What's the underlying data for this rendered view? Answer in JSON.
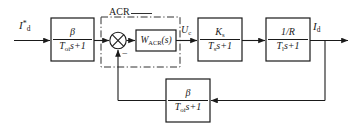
{
  "diagram": {
    "type": "control-block-diagram",
    "stroke_color": "#1a1a1a",
    "text_color": "#1a1a1a",
    "background": "#ffffff"
  },
  "labels": {
    "input_reference": "I",
    "input_reference_sub": "d",
    "input_reference_sup": "*",
    "acr_group": "ACR",
    "control_voltage": "U",
    "control_voltage_sub": "c",
    "output_current": "I",
    "output_current_sub": "d",
    "summing_minus": "−"
  },
  "blocks": [
    {
      "name": "input-filter-block",
      "numerator": "β",
      "denominator_T": "T",
      "denominator_sub": "oi",
      "denominator_tail": "s+1"
    },
    {
      "name": "acr-regulator-block",
      "text": "W",
      "text_sub": "ACR",
      "text_tail": "(s)"
    },
    {
      "name": "converter-block",
      "numerator_K": "K",
      "numerator_sub": "s",
      "denominator_T": "T",
      "denominator_sub": "s",
      "denominator_tail": "s+1"
    },
    {
      "name": "armature-circuit-block",
      "numerator": "1/R",
      "denominator_T": "T",
      "denominator_sub": "l",
      "denominator_tail": "s+1"
    },
    {
      "name": "current-feedback-block",
      "numerator": "β",
      "denominator_T": "T",
      "denominator_sub": "oi",
      "denominator_tail": "s+1"
    }
  ]
}
